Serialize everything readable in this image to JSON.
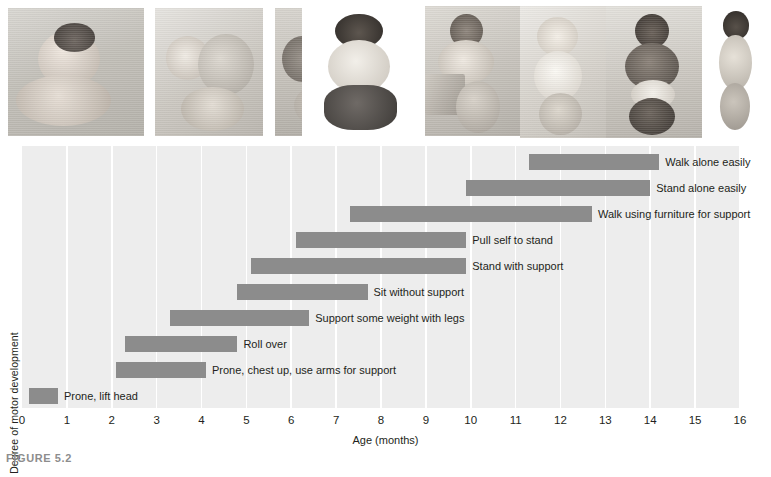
{
  "figure": {
    "caption": "FIGURE 5.2"
  },
  "photos": {
    "alt_items": [
      {
        "name": "infant-prone-lift-head",
        "caption": "infant prone lifting head"
      },
      {
        "name": "infant-rolling-over",
        "caption": "infant rolling over"
      },
      {
        "name": "infant-crawling",
        "caption": "infant crawling on hands and knees"
      },
      {
        "name": "infant-sitting-without-support",
        "caption": "infant sitting without support"
      },
      {
        "name": "infant-pulling-self-to-stand",
        "caption": "infant pulling self to stand at a box"
      },
      {
        "name": "infant-standing-with-support",
        "caption": "infant standing holding furniture"
      },
      {
        "name": "infant-walking-with-help",
        "caption": "infant walking held by adult hands"
      },
      {
        "name": "toddler-walking-alone",
        "caption": "toddler walking alone"
      }
    ]
  },
  "chart_data": {
    "type": "bar",
    "orientation": "horizontal",
    "title": "",
    "xlabel": "Age (months)",
    "ylabel": "Degree of motor development",
    "xlim": [
      0,
      16
    ],
    "xticks": [
      0,
      1,
      2,
      3,
      4,
      5,
      6,
      7,
      8,
      9,
      10,
      11,
      12,
      13,
      14,
      15,
      16
    ],
    "grid": "vertical-white-gridlines",
    "legend": "none",
    "bar_color": "#8c8c8c",
    "plot_background": "#ededed",
    "categories": [
      "Walk alone easily",
      "Stand alone easily",
      "Walk using furniture for support",
      "Pull self to stand",
      "Stand with support",
      "Sit without support",
      "Support some weight with legs",
      "Roll over",
      "Prone, chest up, use arms for support",
      "Prone, lift head"
    ],
    "ranges": [
      {
        "label": "Walk alone easily",
        "start": 11.3,
        "end": 14.2
      },
      {
        "label": "Stand alone easily",
        "start": 9.9,
        "end": 14.0
      },
      {
        "label": "Walk using furniture for support",
        "start": 7.3,
        "end": 12.7
      },
      {
        "label": "Pull self to stand",
        "start": 6.1,
        "end": 9.9
      },
      {
        "label": "Stand with support",
        "start": 5.1,
        "end": 9.9
      },
      {
        "label": "Sit without support",
        "start": 4.8,
        "end": 7.7
      },
      {
        "label": "Support some weight with legs",
        "start": 3.3,
        "end": 6.4
      },
      {
        "label": "Roll over",
        "start": 2.3,
        "end": 4.8
      },
      {
        "label": "Prone, chest up, use arms for support",
        "start": 2.1,
        "end": 4.1
      },
      {
        "label": "Prone, lift head",
        "start": 0.15,
        "end": 0.8
      }
    ],
    "units": "months"
  }
}
